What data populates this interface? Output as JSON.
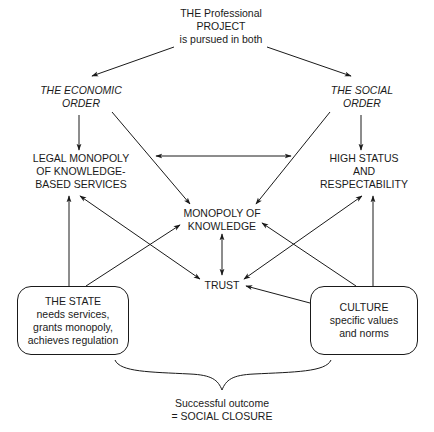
{
  "diagram": {
    "title_node": {
      "lines": [
        "THE Professional",
        "PROJECT",
        "is pursued in both"
      ]
    },
    "economic_order": {
      "lines": [
        "THE ECONOMIC",
        "ORDER"
      ]
    },
    "social_order": {
      "lines": [
        "THE SOCIAL",
        "ORDER"
      ]
    },
    "legal_monopoly": {
      "lines": [
        "LEGAL MONOPOLY",
        "OF KNOWLEDGE-",
        "BASED SERVICES"
      ]
    },
    "high_status": {
      "lines": [
        "HIGH STATUS",
        "AND",
        "RESPECTABILITY"
      ]
    },
    "monopoly_knowledge": {
      "lines": [
        "MONOPOLY OF",
        "KNOWLEDGE"
      ]
    },
    "trust": {
      "lines": [
        "TRUST"
      ]
    },
    "state_box": {
      "lines": [
        "THE STATE",
        "needs services,",
        "grants monopoly,",
        "achieves regulation"
      ]
    },
    "culture_box": {
      "lines": [
        "CULTURE",
        "specific values",
        "and norms"
      ]
    },
    "outcome": {
      "lines": [
        "Successful outcome",
        "= SOCIAL CLOSURE"
      ]
    },
    "edges": [
      {
        "from": "title_node",
        "to": "economic_order",
        "type": "arrow"
      },
      {
        "from": "title_node",
        "to": "social_order",
        "type": "arrow"
      },
      {
        "from": "economic_order",
        "to": "legal_monopoly",
        "type": "arrow"
      },
      {
        "from": "social_order",
        "to": "high_status",
        "type": "arrow"
      },
      {
        "from": "economic_order",
        "to": "monopoly_knowledge",
        "type": "arrow"
      },
      {
        "from": "social_order",
        "to": "monopoly_knowledge",
        "type": "arrow"
      },
      {
        "from": "legal_monopoly",
        "to": "high_status",
        "type": "double-arrow"
      },
      {
        "from": "monopoly_knowledge",
        "to": "trust",
        "type": "double-arrow"
      },
      {
        "from": "legal_monopoly",
        "to": "trust",
        "type": "double-arrow"
      },
      {
        "from": "high_status",
        "to": "trust",
        "type": "double-arrow"
      },
      {
        "from": "state_box",
        "to": "legal_monopoly",
        "type": "arrow"
      },
      {
        "from": "state_box",
        "to": "monopoly_knowledge",
        "type": "arrow"
      },
      {
        "from": "culture_box",
        "to": "high_status",
        "type": "arrow"
      },
      {
        "from": "culture_box",
        "to": "monopoly_knowledge",
        "type": "arrow"
      },
      {
        "from": "culture_box",
        "to": "trust",
        "type": "arrow"
      },
      {
        "from": [
          "state_box",
          "culture_box"
        ],
        "to": "outcome",
        "type": "brace"
      }
    ],
    "colors": {
      "ink": "#1a1a1a",
      "background": "#ffffff"
    }
  }
}
